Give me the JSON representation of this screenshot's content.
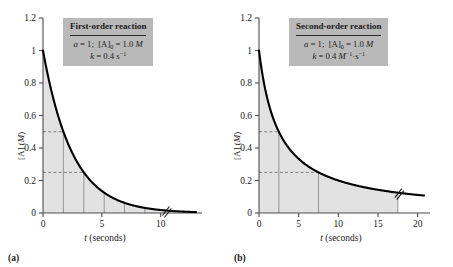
{
  "figure": {
    "panels": [
      {
        "id": "a",
        "sublabel": "(a)",
        "box": {
          "title": "First-order reaction",
          "line1_html": "<i>a</i> = 1;&nbsp; [A]<sub>0</sub> = 1.0 <i>M</i>",
          "line2_html": "<i>k</i> = 0.4 s<sup>−1</sup>",
          "bg_color": "#b9b9b9"
        },
        "axes": {
          "xlabel_html": "<i>t</i> (seconds)",
          "ylabel_html": "[A] (<i>M</i>)",
          "xticks": [
            "0",
            "5",
            "10"
          ],
          "xtick_values": [
            0,
            5,
            10
          ],
          "yticks": [
            "0",
            "0.2",
            "0.4",
            "0.6",
            "0.8",
            "1",
            "1.2"
          ],
          "ytick_values": [
            0,
            0.2,
            0.4,
            0.6,
            0.8,
            1.0,
            1.2
          ],
          "xlim": [
            0,
            13
          ],
          "ylim": [
            0,
            1.2
          ]
        },
        "half_life_lines": [
          1.73,
          3.47,
          5.2,
          6.93,
          8.66,
          10.4
        ],
        "dashed_levels": [
          0.5,
          0.25
        ],
        "curve_label": "[A] = 1.0 e^(-0.4 t)"
      },
      {
        "id": "b",
        "sublabel": "(b)",
        "box": {
          "title": "Second-order reaction",
          "line1_html": "<i>a</i> = 1;&nbsp; [A]<sub>0</sub> = 1.0 <i>M</i>",
          "line2_html": "<i>k</i> = 0.4 <i>M</i><sup>−1</sup>·s<sup>−1</sup>",
          "bg_color": "#b9b9b9"
        },
        "axes": {
          "xlabel_html": "<i>t</i> (seconds)",
          "ylabel_html": "[A] (<i>M</i>)",
          "xticks": [
            "0",
            "5",
            "10",
            "15",
            "20"
          ],
          "xtick_values": [
            0,
            5,
            10,
            15,
            20
          ],
          "yticks": [
            "0",
            "0.2",
            "0.4",
            "0.6",
            "0.8",
            "1",
            "1.2"
          ],
          "ytick_values": [
            0,
            0.2,
            0.4,
            0.6,
            0.8,
            1.0,
            1.2
          ],
          "xlim": [
            0,
            20.8
          ],
          "ylim": [
            0,
            1.2
          ]
        },
        "half_life_lines": [
          2.5,
          7.5,
          17.5
        ],
        "dashed_levels": [
          0.5,
          0.25
        ],
        "curve_label": "[A] = 1.0 / (1 + 0.4 t)"
      }
    ],
    "style": {
      "fill_color": "#e2e2e2",
      "curve_color": "#000000",
      "axis_color": "#4d4d4d",
      "gridline_color": "#8c8c8c",
      "dash_color": "#808080"
    }
  },
  "chart_data": [
    {
      "type": "line",
      "title": "First-order reaction",
      "panel": "(a)",
      "xlabel": "t (seconds)",
      "ylabel": "[A] (M)",
      "xlim": [
        0,
        13
      ],
      "ylim": [
        0,
        1.2
      ],
      "xticks": [
        0,
        5,
        10
      ],
      "yticks": [
        0,
        0.2,
        0.4,
        0.6,
        0.8,
        1.0,
        1.2
      ],
      "grid": false,
      "legend": null,
      "annotations": [
        "a = 1; [A]0 = 1.0 M",
        "k = 0.4 s^-1",
        "half-life t(1/2) = 1.73 s, constant"
      ],
      "equation": "[A] = [A]0 * exp(-k t) = 1.0 * exp(-0.4 t)",
      "series": [
        {
          "name": "[A] vs t (first-order)",
          "x": [
            0,
            0.5,
            1,
            1.5,
            1.73,
            2,
            2.5,
            3,
            3.47,
            4,
            5,
            5.2,
            6,
            6.93,
            8,
            8.66,
            10,
            10.4,
            12,
            13
          ],
          "y": [
            1.0,
            0.819,
            0.67,
            0.549,
            0.5,
            0.449,
            0.368,
            0.301,
            0.25,
            0.202,
            0.135,
            0.125,
            0.091,
            0.0625,
            0.041,
            0.031,
            0.018,
            0.0156,
            0.008,
            0.0055
          ]
        }
      ],
      "vertical_lines": [
        1.73,
        3.47,
        5.2,
        6.93,
        8.66,
        10.4
      ],
      "horizontal_dashed": [
        0.5,
        0.25
      ],
      "shaded_region": "area under curve from t=0 to t=10.4"
    },
    {
      "type": "line",
      "title": "Second-order reaction",
      "panel": "(b)",
      "xlabel": "t (seconds)",
      "ylabel": "[A] (M)",
      "xlim": [
        0,
        20.8
      ],
      "ylim": [
        0,
        1.2
      ],
      "xticks": [
        0,
        5,
        10,
        15,
        20
      ],
      "yticks": [
        0,
        0.2,
        0.4,
        0.6,
        0.8,
        1.0,
        1.2
      ],
      "grid": false,
      "legend": null,
      "annotations": [
        "a = 1; [A]0 = 1.0 M",
        "k = 0.4 M^-1 s^-1",
        "half-life doubles each time: 2.5 s, 5 s, 10 s"
      ],
      "equation": "[A] = [A]0 / (1 + k [A]0 t) = 1.0 / (1 + 0.4 t)",
      "series": [
        {
          "name": "[A] vs t (second-order)",
          "x": [
            0,
            0.5,
            1,
            1.5,
            2,
            2.5,
            3,
            4,
            5,
            6,
            7.5,
            9,
            10,
            12,
            14,
            15,
            17.5,
            20
          ],
          "y": [
            1.0,
            0.833,
            0.714,
            0.625,
            0.556,
            0.5,
            0.455,
            0.385,
            0.333,
            0.294,
            0.25,
            0.217,
            0.2,
            0.172,
            0.151,
            0.143,
            0.125,
            0.111
          ]
        }
      ],
      "vertical_lines": [
        2.5,
        7.5,
        17.5
      ],
      "horizontal_dashed": [
        0.5,
        0.25
      ],
      "shaded_region": "area under curve from t=0 to t=20"
    }
  ]
}
